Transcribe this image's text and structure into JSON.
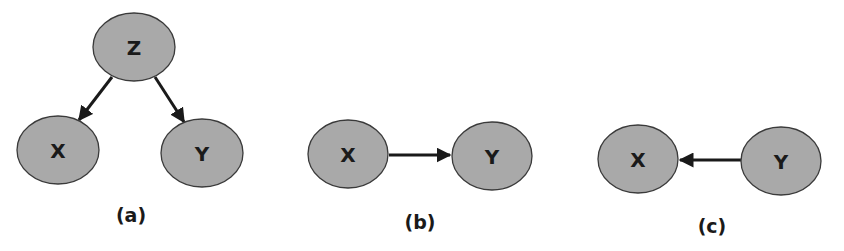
{
  "diagrams": [
    {
      "caption": "(a)",
      "nodes": [
        {
          "id": "Z",
          "label": "Z",
          "cx": 134,
          "cy": 47
        },
        {
          "id": "X",
          "label": "X",
          "cx": 58,
          "cy": 150
        },
        {
          "id": "Y",
          "label": "Y",
          "cx": 202,
          "cy": 153
        }
      ],
      "edges": [
        {
          "from": "Z",
          "to": "X"
        },
        {
          "from": "Z",
          "to": "Y"
        }
      ]
    },
    {
      "caption": "(b)",
      "nodes": [
        {
          "id": "X",
          "label": "X",
          "cx": 348,
          "cy": 154
        },
        {
          "id": "Y",
          "label": "Y",
          "cx": 492,
          "cy": 156
        }
      ],
      "edges": [
        {
          "from": "X",
          "to": "Y"
        }
      ]
    },
    {
      "caption": "(c)",
      "nodes": [
        {
          "id": "X",
          "label": "X",
          "cx": 638,
          "cy": 159
        },
        {
          "id": "Y",
          "label": "Y",
          "cx": 781,
          "cy": 161
        }
      ],
      "edges": [
        {
          "from": "Y",
          "to": "X"
        }
      ]
    }
  ],
  "colors": {
    "node_fill": "#a9a9a9",
    "node_stroke": "#3a3a3a",
    "edge": "#1a1a1a"
  }
}
